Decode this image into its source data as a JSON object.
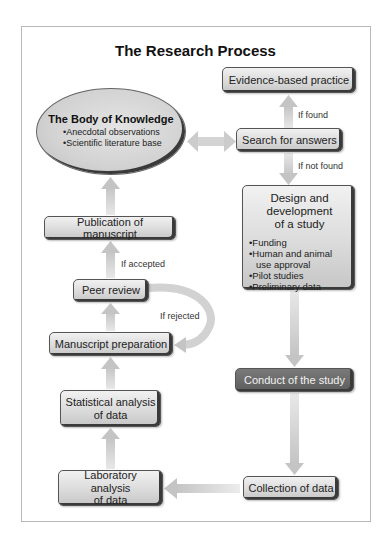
{
  "title": "The Research Process",
  "colors": {
    "arrow": "#cfcfcf",
    "box_light": "#d9d9d9",
    "box_dark": "#666666",
    "frame": "#b8b8b8"
  },
  "nodes": {
    "evidence": {
      "label": "Evidence-based practice"
    },
    "search": {
      "label": "Search for answers"
    },
    "body_of_knowledge": {
      "title": "The Body of Knowledge",
      "items": [
        "Anecdotal observations",
        "Scientific literature base"
      ]
    },
    "design": {
      "title_lines": [
        "Design and",
        "development",
        "of a study"
      ],
      "items": [
        "Funding",
        "Human and animal",
        "use approval",
        "Pilot studies",
        "Preliminary data"
      ]
    },
    "publication": {
      "label": "Publication of manuscript"
    },
    "peer_review": {
      "label": "Peer review"
    },
    "manuscript_prep": {
      "label": "Manuscript preparation"
    },
    "statistical": {
      "lines": [
        "Statistical analysis",
        "of data"
      ]
    },
    "laboratory": {
      "lines": [
        "Laboratory analysis",
        "of data"
      ]
    },
    "conduct": {
      "label": "Conduct of the study"
    },
    "collection": {
      "label": "Collection of data"
    }
  },
  "edge_labels": {
    "if_found": "If found",
    "if_not_found": "If not found",
    "if_accepted": "If accepted",
    "if_rejected": "If rejected"
  }
}
